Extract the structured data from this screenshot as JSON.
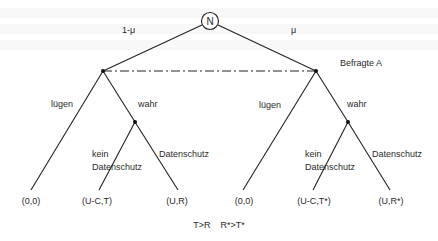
{
  "diagram": {
    "type": "game-tree",
    "root": {
      "label": "N",
      "x": 210,
      "y": 21
    },
    "info_set_label": "Befragte A",
    "nature_moves": [
      {
        "label": "1-μ"
      },
      {
        "label": "μ"
      }
    ],
    "branches": {
      "left": {
        "lie": "lügen",
        "truth": "wahr",
        "no_privacy": [
          "kein",
          "Datenschutz"
        ],
        "privacy": "Datenschutz"
      },
      "right": {
        "lie": "lügen",
        "truth": "wahr",
        "no_privacy": [
          "kein",
          "Datenschutz"
        ],
        "privacy": "Datenschutz"
      }
    },
    "payoffs": [
      "(0,0)",
      "(U-C,T)",
      "(U,R)",
      "(0,0)",
      "(U-C,T*)",
      "(U,R*)"
    ],
    "condition": "T>R    R*>T*"
  }
}
